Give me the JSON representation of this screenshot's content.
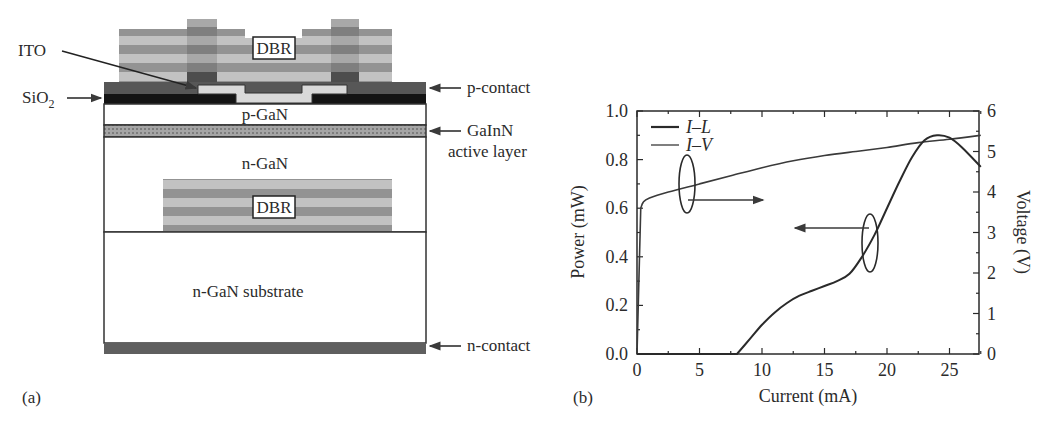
{
  "panel_a": {
    "label": "(a)",
    "layers": {
      "top_dbr": "DBR",
      "bottom_dbr": "DBR",
      "p_gan": "p-GaN",
      "n_gan": "n-GaN",
      "substrate": "n-GaN substrate"
    },
    "callouts": {
      "ito": "ITO",
      "sio2_main": "SiO",
      "sio2_sub": "2",
      "p_contact": "p-contact",
      "active_line1": "GaInN",
      "active_line2": "active layer",
      "n_contact": "n-contact"
    },
    "colors": {
      "dbr_light": "#bdbdbd",
      "dbr_dark": "#8f8f8f",
      "contact": "#5a5a5a",
      "sio2": "#141414",
      "ito": "#d6d6d6",
      "active": "#9a9a9a"
    }
  },
  "panel_b": {
    "label": "(b)",
    "x_ticks": [
      "0",
      "5",
      "10",
      "15",
      "20",
      "25"
    ],
    "y_left_ticks": [
      "0.0",
      "0.2",
      "0.4",
      "0.6",
      "0.8",
      "1.0"
    ],
    "y_right_ticks": [
      "0",
      "1",
      "2",
      "3",
      "4",
      "5",
      "6"
    ],
    "xlabel": "Current (mA)",
    "ylabel_left": "Power (mW)",
    "ylabel_right": "Voltage (V)",
    "legend": [
      "I–L",
      "I–V"
    ]
  },
  "chart_data": {
    "type": "line",
    "title": "",
    "xlabel": "Current (mA)",
    "ylabel": "Power (mW)",
    "ylabel_right": "Voltage (V)",
    "xlim": [
      0,
      27.5
    ],
    "ylim": [
      0,
      1.0
    ],
    "ylim_right": [
      0,
      6
    ],
    "grid": false,
    "legend_position": "upper left",
    "series": [
      {
        "name": "I–L",
        "axis": "left",
        "x": [
          0,
          8,
          9,
          10,
          11,
          12,
          13,
          14,
          15,
          16,
          17,
          18,
          19,
          20,
          21,
          22,
          23,
          24,
          25,
          26,
          27.5
        ],
        "values": [
          0,
          0,
          0.06,
          0.12,
          0.17,
          0.21,
          0.24,
          0.26,
          0.28,
          0.3,
          0.33,
          0.4,
          0.49,
          0.6,
          0.71,
          0.81,
          0.88,
          0.9,
          0.89,
          0.85,
          0.77
        ]
      },
      {
        "name": "I–V",
        "axis": "right",
        "x": [
          0,
          0.3,
          0.5,
          1,
          2.5,
          5,
          7.5,
          10,
          12.5,
          15,
          17.5,
          20,
          22.5,
          25,
          27.5
        ],
        "values": [
          0,
          3.6,
          3.75,
          3.85,
          4.0,
          4.2,
          4.4,
          4.6,
          4.77,
          4.9,
          5.0,
          5.1,
          5.22,
          5.3,
          5.4
        ]
      }
    ],
    "annotations": [
      {
        "type": "ellipse-arrow",
        "at_x": 4,
        "points_to": "right axis (I–V)"
      },
      {
        "type": "ellipse-arrow",
        "at_x": 18.8,
        "points_to": "left axis (I–L)"
      }
    ]
  }
}
